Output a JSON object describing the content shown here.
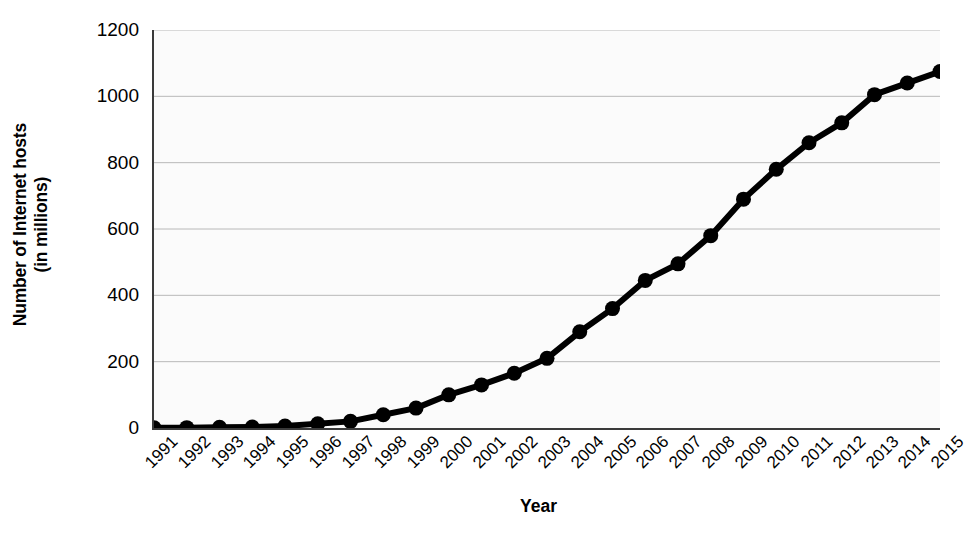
{
  "chart_data": {
    "type": "line",
    "title": "",
    "xlabel": "Year",
    "ylabel": "Number of Internet hosts (in millions)",
    "ylabel_line1": "Number of Internet hosts",
    "ylabel_line2": "(in millions)",
    "categories": [
      "1991",
      "1992",
      "1993",
      "1994",
      "1995",
      "1996",
      "1997",
      "1998",
      "1999",
      "2000",
      "2001",
      "2002",
      "2003",
      "2004",
      "2005",
      "2006",
      "2007",
      "2008",
      "2009",
      "2010",
      "2011",
      "2012",
      "2013",
      "2014",
      "2015"
    ],
    "values": [
      0.6,
      1,
      2,
      3,
      6,
      13,
      20,
      40,
      60,
      100,
      130,
      165,
      210,
      290,
      360,
      445,
      495,
      580,
      690,
      780,
      860,
      920,
      1005,
      1040,
      1075
    ],
    "series": [
      {
        "name": "Number of Internet hosts",
        "values": [
          0.6,
          1,
          2,
          3,
          6,
          13,
          20,
          40,
          60,
          100,
          130,
          165,
          210,
          290,
          360,
          445,
          495,
          580,
          690,
          780,
          860,
          920,
          1005,
          1040,
          1075
        ]
      }
    ],
    "ylim": [
      0,
      1200
    ],
    "yticks": [
      0,
      200,
      400,
      600,
      800,
      1000,
      1200
    ],
    "ytick_labels": [
      "0",
      "200",
      "400",
      "600",
      "800",
      "1000",
      "1200"
    ],
    "grid": "horizontal",
    "legend": "none",
    "line_color": "#000000",
    "marker": "circle",
    "marker_color": "#000000",
    "grid_color": "#b8b8b8",
    "plot_background": "#fbfbfb",
    "axis_color": "#3a3a3a",
    "xtick_rotation": -45
  }
}
